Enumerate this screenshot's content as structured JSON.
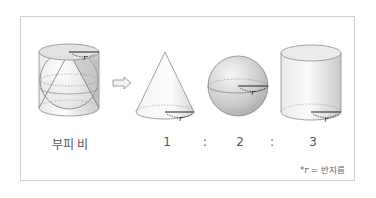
{
  "figure": {
    "combined_figure": {
      "description": "cylinder containing inscribed sphere and cone",
      "radius_label": "r"
    },
    "arrow": "right-arrow",
    "shapes": [
      {
        "name": "cone",
        "radius_label": "r"
      },
      {
        "name": "sphere",
        "radius_label": "r"
      },
      {
        "name": "cylinder",
        "radius_label": "r"
      }
    ]
  },
  "labels": {
    "volume_ratio": "부피 비",
    "cone_value": "1",
    "sep1": ":",
    "sphere_value": "2",
    "sep2": ":",
    "cylinder_value": "3"
  },
  "footnote": {
    "prefix": "*",
    "symbol": "r",
    "text": " = 반지름"
  },
  "colors": {
    "border": "#cfcfcf",
    "outline": "#8a8a8a",
    "text": "#555555"
  }
}
